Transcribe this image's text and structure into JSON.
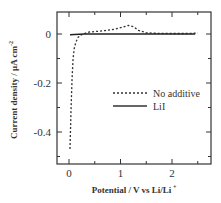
{
  "chart_data": {
    "type": "line",
    "title": "",
    "xlabel": "Potential  /  V vs Li/Li",
    "xlabel_superscript": "+",
    "ylabel": "Current density  /  μA cm",
    "ylabel_superscript": "-2",
    "xlim": [
      -0.2,
      2.7
    ],
    "ylim": [
      -0.52,
      0.09
    ],
    "xticks": [
      0,
      1,
      2
    ],
    "xtick_labels": [
      "0",
      "1",
      "2"
    ],
    "yticks": [
      0,
      -0.2,
      -0.4
    ],
    "ytick_labels": [
      "0",
      "-0.2",
      "-0.4"
    ],
    "grid": false,
    "legend_position": "center-right",
    "series": [
      {
        "name": "No additive",
        "style": "dashed",
        "color": "#333333",
        "x": [
          0.02,
          0.04,
          0.06,
          0.08,
          0.1,
          0.13,
          0.17,
          0.22,
          0.3,
          0.4,
          0.5,
          0.7,
          0.9,
          1.05,
          1.15,
          1.25,
          1.35,
          1.5,
          1.7,
          2.0,
          2.3,
          2.5
        ],
        "y": [
          -0.47,
          -0.3,
          -0.18,
          -0.1,
          -0.06,
          -0.035,
          -0.015,
          -0.005,
          0.002,
          0.008,
          0.01,
          0.014,
          0.02,
          0.028,
          0.035,
          0.03,
          0.015,
          0.005,
          0.003,
          0.002,
          0.002,
          0.004
        ]
      },
      {
        "name": "LiI",
        "style": "solid",
        "color": "#222222",
        "x": [
          0.02,
          0.1,
          0.2,
          0.3,
          0.5,
          1.0,
          1.5,
          2.0,
          2.45
        ],
        "y": [
          -0.003,
          -0.002,
          -0.001,
          0.0,
          0.0,
          0.0,
          0.0,
          0.0,
          0.0
        ]
      }
    ]
  },
  "legend": {
    "items": [
      {
        "label": "No additive",
        "style": "dashed"
      },
      {
        "label": "LiI",
        "style": "solid"
      }
    ]
  }
}
